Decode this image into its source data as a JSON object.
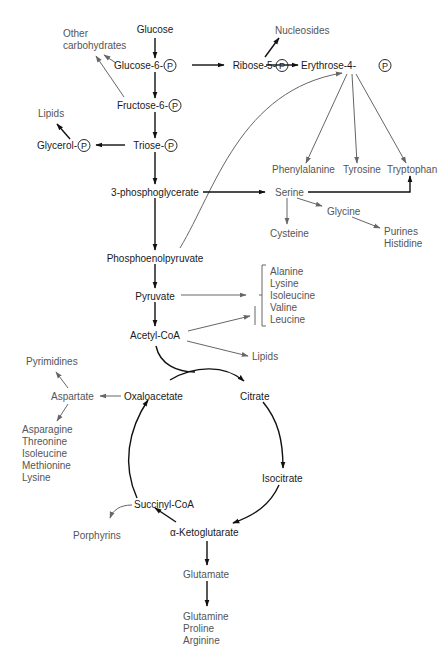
{
  "core": {
    "glucose": "Glucose",
    "g6p": "Glucose-6-",
    "f6p": "Fructose-6-",
    "triose": "Triose-",
    "glycerol": "Glycerol-",
    "r5p": "Ribose-5-",
    "e4p": "Erythrose-4-",
    "pg3": "3-phosphoglycerate",
    "pep": "Phosphoenolpyruvate",
    "pyruvate": "Pyruvate",
    "acetylcoa": "Acetyl-CoA",
    "oxaloacetate": "Oxaloacetate",
    "citrate": "Citrate",
    "isocitrate": "Isocitrate",
    "akg": "α-Ketoglutarate",
    "succinylcoa": "Succinyl-CoA",
    "phosphate_symbol": "P"
  },
  "products": {
    "other_carbs_1": "Other",
    "other_carbs_2": "carbohydrates",
    "lipids_top": "Lipids",
    "nucleosides": "Nucleosides",
    "phenylalanine": "Phenylalanine",
    "tyrosine": "Tyrosine",
    "tryptophan": "Tryptophan",
    "serine": "Serine",
    "glycine": "Glycine",
    "cysteine": "Cysteine",
    "purines": "Purines",
    "histidine": "Histidine",
    "pyruvate_aas": [
      "Alanine",
      "Lysine",
      "Isoleucine",
      "Valine",
      "Leucine"
    ],
    "lipids_acetyl": "Lipids",
    "pyrimidines": "Pyrimidines",
    "aspartate": "Aspartate",
    "aspartate_aas": [
      "Asparagine",
      "Threonine",
      "Isoleucine",
      "Methionine",
      "Lysine"
    ],
    "porphyrins": "Porphyrins",
    "glutamate": "Glutamate",
    "glutamate_aas": [
      "Glutamine",
      "Proline",
      "Arginine"
    ]
  },
  "colors": {
    "core_text": "#1a1a1a",
    "product_text": "#555555",
    "core_arrow": "#111111",
    "product_arrow": "#666666"
  }
}
